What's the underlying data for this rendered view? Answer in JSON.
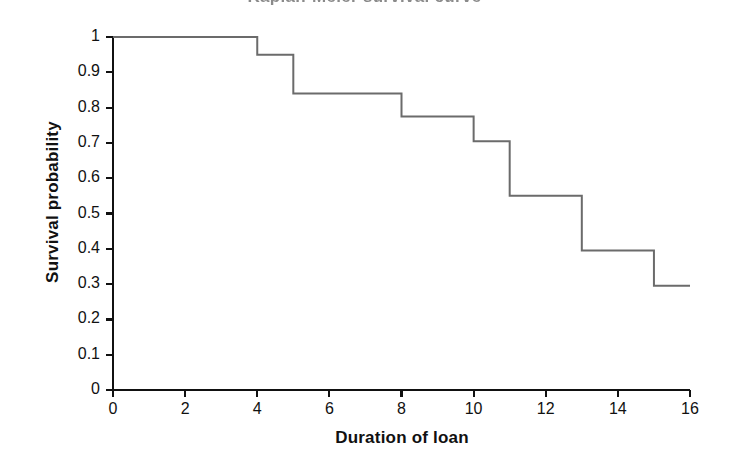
{
  "chart_data": {
    "type": "line",
    "step": "post",
    "title": "Kaplan-Meier survival curve",
    "title_clipped": true,
    "xlabel": "Duration of loan",
    "ylabel": "Survival probability",
    "xlim": [
      0,
      16
    ],
    "ylim": [
      0,
      1
    ],
    "grid": false,
    "legend": null,
    "xticks": [
      0,
      2,
      4,
      6,
      8,
      10,
      12,
      14,
      16
    ],
    "xtick_labels": [
      "0",
      "2",
      "4",
      "6",
      "8",
      "10",
      "12",
      "14",
      "16"
    ],
    "yticks": [
      0,
      0.1,
      0.2,
      0.3,
      0.4,
      0.5,
      0.6,
      0.7,
      0.8,
      0.9,
      1
    ],
    "ytick_labels": [
      "0",
      "0.1",
      "0.2",
      "0.3",
      "0.4",
      "0.5",
      "0.6",
      "0.7",
      "0.8",
      "0.9",
      "1"
    ],
    "series": [
      {
        "name": "Survival probability",
        "color": "#6b6b6b",
        "line_width": 2,
        "x": [
          0,
          4,
          4,
          5,
          5,
          8,
          8,
          10,
          10,
          11,
          11,
          13,
          13,
          15,
          15,
          16
        ],
        "y": [
          1,
          1,
          0.95,
          0.95,
          0.84,
          0.84,
          0.775,
          0.775,
          0.705,
          0.705,
          0.55,
          0.55,
          0.395,
          0.395,
          0.295,
          0.295
        ]
      }
    ],
    "steps": [
      {
        "x": 0,
        "value": 1
      },
      {
        "x": 4,
        "value": 0.95
      },
      {
        "x": 5,
        "value": 0.84
      },
      {
        "x": 8,
        "value": 0.775
      },
      {
        "x": 10,
        "value": 0.705
      },
      {
        "x": 11,
        "value": 0.55
      },
      {
        "x": 13,
        "value": 0.395
      },
      {
        "x": 15,
        "value": 0.295
      }
    ],
    "axis_color": "#111111",
    "background_color": "#ffffff"
  }
}
